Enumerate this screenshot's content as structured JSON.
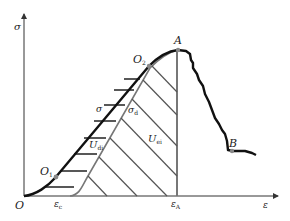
{
  "diagram": {
    "type": "stress-strain energy diagram",
    "axes": {
      "y_label": "σ",
      "x_label": "ε",
      "origin_label": "O"
    },
    "points": {
      "A": {
        "label": "A"
      },
      "B": {
        "label": "B"
      },
      "O1": {
        "label": "O",
        "sub": "1"
      },
      "O2": {
        "label": "O",
        "sub": "2"
      }
    },
    "curves": {
      "sigma": {
        "label": "σ"
      },
      "sigma_d": {
        "label": "σ",
        "sub": "d"
      }
    },
    "regions": {
      "U_di": {
        "label": "U",
        "sub": "di"
      },
      "U_ei": {
        "label": "U",
        "sub": "ei"
      }
    },
    "x_ticks": {
      "eps_c": {
        "label": "ε",
        "sub": "c"
      },
      "eps_A": {
        "label": "ε",
        "sub": "A"
      }
    },
    "colors": {
      "curve": "#111111",
      "gray_line": "#777777",
      "axis": "#333333",
      "point": "#888888"
    }
  }
}
